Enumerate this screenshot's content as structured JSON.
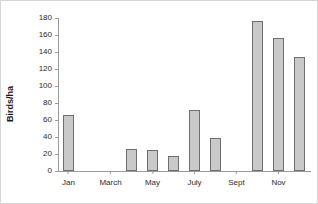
{
  "chart_data": {
    "type": "bar",
    "title": "",
    "xlabel": "",
    "ylabel": "Birds/ha",
    "ylim": [
      0,
      180
    ],
    "yticks": [
      0,
      20,
      40,
      60,
      80,
      100,
      120,
      140,
      160,
      180
    ],
    "grid": false,
    "legend": null,
    "categories": [
      "Jan",
      "Feb",
      "March",
      "April",
      "May",
      "June",
      "July",
      "Aug",
      "Sept",
      "Oct",
      "Nov",
      "Dec"
    ],
    "xtick_labels": [
      "Jan",
      "March",
      "May",
      "July",
      "Sept",
      "Nov"
    ],
    "xtick_categories": [
      "Jan",
      "March",
      "May",
      "July",
      "Sept",
      "Nov"
    ],
    "values": [
      66,
      0,
      0,
      26,
      25,
      18,
      72,
      39,
      0,
      176,
      156,
      134
    ],
    "bar_fill_color": "#c9c9c9",
    "bar_edge_color": "#6e6e6e",
    "axis_color": "#9a9a9a",
    "background_color": "#ffffff"
  }
}
